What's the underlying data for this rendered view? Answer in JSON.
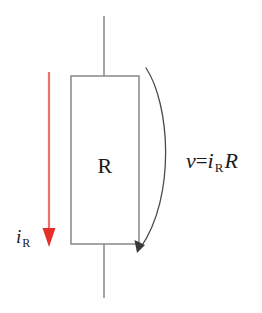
{
  "figure": {
    "background_color": "#ffffff",
    "width": 262,
    "height": 313
  },
  "resistor": {
    "label": "R",
    "stroke_color": "#8f8f8f",
    "box": {
      "x": 71,
      "y": 76,
      "width": 68,
      "height": 168
    }
  },
  "wires": {
    "stroke_color": "#8f8f8f",
    "top": {
      "x": 104,
      "y1": 16,
      "y2": 76
    },
    "bottom": {
      "x": 104,
      "y1": 244,
      "y2": 298
    }
  },
  "current_arrow": {
    "label_symbol": "i",
    "label_subscript": "R",
    "line_color": "#e8736a",
    "head_color": "#e5302a",
    "direction": "down",
    "x": 49,
    "y_start": 72,
    "y_end": 247
  },
  "voltage_arrow": {
    "stroke_color": "#4a4a4a",
    "direction": "clockwise-down",
    "start": {
      "x": 146,
      "y": 68
    },
    "end": {
      "x": 139,
      "y": 250
    },
    "bulge_x": 174
  },
  "ohms_law": {
    "v_symbol": "v",
    "equals": "=",
    "i_symbol": "i",
    "i_subscript": "R",
    "r_symbol": "R",
    "full_text": "v=i R R"
  }
}
